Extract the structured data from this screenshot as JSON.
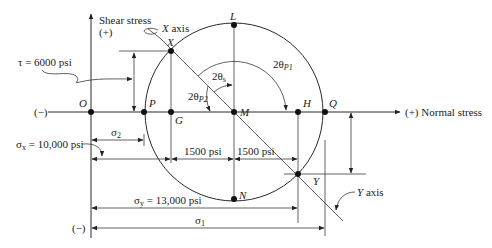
{
  "diagram": {
    "type": "mohrs-circle",
    "axes": {
      "vertical_label_line1": "Shear stress",
      "vertical_label_line2": "(+)",
      "horizontal_label": "(+) Normal stress",
      "negative_left": "(−)",
      "negative_bottom": "(−)"
    },
    "points": {
      "O": "O",
      "P": "P",
      "G": "G",
      "M": "M",
      "H": "H",
      "Q": "Q",
      "L": "L",
      "N": "N",
      "X": "X",
      "Y": "Y"
    },
    "axis_labels": {
      "x_axis": "X axis",
      "y_axis": "Y axis"
    },
    "angles": {
      "two_theta_s": "2θ",
      "two_theta_s_sub": "s",
      "two_theta_p1": "2θ",
      "two_theta_p1_sub": "P1",
      "two_theta_p2": "2θ",
      "two_theta_p2_sub": "P2"
    },
    "dimensions": {
      "tau": "τ = 6000 psi",
      "sigma_x": "σ",
      "sigma_x_sub": "x",
      "sigma_x_value": " = 10,000 psi",
      "sigma_y": "σ",
      "sigma_y_sub": "y",
      "sigma_y_value": " = 13,000 psi",
      "sigma_1": "σ",
      "sigma_1_sub": "1",
      "sigma_2": "σ",
      "sigma_2_sub": "2",
      "half_diff_left": "1500 psi",
      "half_diff_right": "1500 psi"
    },
    "values": {
      "tau_psi": 6000,
      "sigma_x_psi": 10000,
      "sigma_y_psi": 13000,
      "half_difference_psi": 1500
    }
  }
}
